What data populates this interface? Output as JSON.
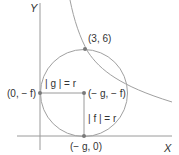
{
  "diagram": {
    "axes": {
      "x_label": "X",
      "y_label": "Y"
    },
    "points": {
      "tangent_point": "(3, 6)",
      "y_tangent": "(0, − f)",
      "center": "(− g, − f)",
      "x_tangent": "(− g, 0)"
    },
    "annotations": {
      "horizontal_radius": "| g | = r",
      "vertical_radius": "| f | = r"
    },
    "colors": {
      "line": "#9a9a9a",
      "dot": "#7a7a7a",
      "text": "#333333"
    }
  }
}
